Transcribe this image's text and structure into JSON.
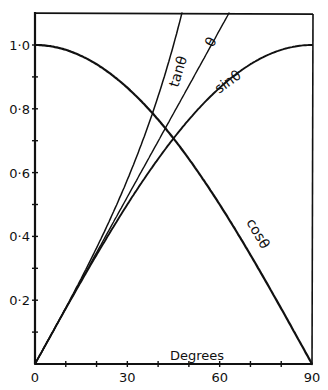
{
  "chart_data": {
    "type": "line",
    "title": "",
    "xlabel": "Degrees",
    "ylabel": "",
    "xlim": [
      0,
      90
    ],
    "ylim": [
      0,
      1.1
    ],
    "grid": false,
    "legend": "none (curves labelled inline)",
    "x_ticks": [
      0,
      10,
      20,
      30,
      40,
      50,
      60,
      70,
      80,
      90
    ],
    "x_tick_labels": [
      {
        "value": 0,
        "label": "0"
      },
      {
        "value": 30,
        "label": "30"
      },
      {
        "value": 60,
        "label": "60"
      },
      {
        "value": 90,
        "label": "90"
      }
    ],
    "y_ticks": [
      0.1,
      0.2,
      0.3,
      0.4,
      0.5,
      0.6,
      0.7,
      0.8,
      0.9,
      1.0
    ],
    "y_tick_labels": [
      {
        "value": 0.2,
        "label": "0·2"
      },
      {
        "value": 0.4,
        "label": "0·4"
      },
      {
        "value": 0.6,
        "label": "0·6"
      },
      {
        "value": 0.8,
        "label": "0·8"
      },
      {
        "value": 1.0,
        "label": "1·0"
      }
    ],
    "series": [
      {
        "name": "tanθ",
        "label": "tanθ",
        "function": "tan",
        "x": [
          0,
          10,
          20,
          30,
          40,
          45,
          47.7
        ],
        "values": [
          0,
          0.176,
          0.364,
          0.577,
          0.839,
          1.0,
          1.1
        ]
      },
      {
        "name": "θ",
        "label": "θ",
        "function": "radians",
        "x": [
          0,
          10,
          20,
          30,
          40,
          50,
          60,
          63
        ],
        "values": [
          0,
          0.175,
          0.349,
          0.524,
          0.698,
          0.873,
          1.047,
          1.1
        ]
      },
      {
        "name": "sinθ",
        "label": "sinθ",
        "function": "sin",
        "x": [
          0,
          10,
          20,
          30,
          40,
          50,
          60,
          70,
          80,
          90
        ],
        "values": [
          0,
          0.174,
          0.342,
          0.5,
          0.643,
          0.766,
          0.866,
          0.94,
          0.985,
          1.0
        ]
      },
      {
        "name": "cosθ",
        "label": "cosθ",
        "function": "cos",
        "x": [
          0,
          10,
          20,
          30,
          40,
          50,
          60,
          70,
          80,
          90
        ],
        "values": [
          1.0,
          0.985,
          0.94,
          0.866,
          0.766,
          0.643,
          0.5,
          0.342,
          0.174,
          0
        ]
      }
    ],
    "annotations": [
      {
        "text": "tanθ",
        "near_series": "tanθ"
      },
      {
        "text": "θ",
        "near_series": "θ"
      },
      {
        "text": "sinθ",
        "near_series": "sinθ"
      },
      {
        "text": "cosθ",
        "near_series": "cosθ"
      },
      {
        "text": "Degrees",
        "position": "above x-axis, right of 60"
      }
    ]
  },
  "labels": {
    "tan": "tanθ",
    "theta": "θ",
    "sin": "sinθ",
    "cos": "cosθ",
    "xlabel": "Degrees"
  },
  "colors": {
    "ink": "#111111",
    "paper": "#ffffff"
  }
}
